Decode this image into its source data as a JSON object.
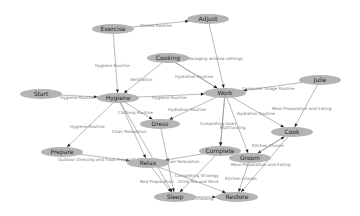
{
  "diagram": {
    "type": "directed-graph",
    "background": "#ffffff",
    "node_color": "#b4b4b4",
    "edge_color": "#8a8a8a",
    "nodes": [
      {
        "id": "exercise",
        "label": "Exercise",
        "x": 113,
        "y": 29,
        "rx": 21,
        "ry": 5
      },
      {
        "id": "adjust",
        "label": "Adjust",
        "x": 208,
        "y": 19,
        "rx": 21,
        "ry": 5
      },
      {
        "id": "cooking",
        "label": "Cooking",
        "x": 168,
        "y": 58,
        "rx": 21,
        "ry": 5
      },
      {
        "id": "start",
        "label": "Start",
        "x": 41,
        "y": 94,
        "rx": 21,
        "ry": 5
      },
      {
        "id": "hygiene",
        "label": "Hygiene",
        "x": 118,
        "y": 98,
        "rx": 21,
        "ry": 5
      },
      {
        "id": "work",
        "label": "Work",
        "x": 225,
        "y": 93,
        "rx": 21,
        "ry": 5
      },
      {
        "id": "julie",
        "label": "Julie",
        "x": 320,
        "y": 80,
        "rx": 21,
        "ry": 5
      },
      {
        "id": "dress",
        "label": "Dress",
        "x": 160,
        "y": 124,
        "rx": 20,
        "ry": 5
      },
      {
        "id": "cook",
        "label": "Cook",
        "x": 292,
        "y": 132,
        "rx": 21,
        "ry": 5
      },
      {
        "id": "prepare",
        "label": "Prepare",
        "x": 62,
        "y": 152,
        "rx": 21,
        "ry": 5
      },
      {
        "id": "complete",
        "label": "Complete",
        "x": 220,
        "y": 151,
        "rx": 21,
        "ry": 5
      },
      {
        "id": "relax",
        "label": "Relax",
        "x": 148,
        "y": 163,
        "rx": 21,
        "ry": 5
      },
      {
        "id": "groom",
        "label": "Groom",
        "x": 250,
        "y": 158,
        "rx": 21,
        "ry": 5
      },
      {
        "id": "sleep",
        "label": "Sleep",
        "x": 175,
        "y": 197,
        "rx": 21,
        "ry": 5
      },
      {
        "id": "restore",
        "label": "Restore",
        "x": 237,
        "y": 197,
        "rx": 21,
        "ry": 5
      }
    ],
    "edges": [
      {
        "from": "exercise",
        "to": "adjust",
        "label": "Fitness Routine",
        "lx": 140,
        "ly": 27
      },
      {
        "from": "exercise",
        "to": "hygiene",
        "label": "Hygiene Routine",
        "lx": 95,
        "ly": 67
      },
      {
        "from": "cooking",
        "to": "hygiene",
        "label": "Ventilation",
        "lx": 130,
        "ly": 81
      },
      {
        "from": "cooking",
        "to": "work",
        "label": "Managing window settings",
        "lx": 187,
        "ly": 60
      },
      {
        "from": "cooking",
        "to": "work",
        "label": "Hydration Routine",
        "lx": 175,
        "ly": 78
      },
      {
        "from": "adjust",
        "to": "work",
        "label": "",
        "lx": 0,
        "ly": 0
      },
      {
        "from": "start",
        "to": "hygiene",
        "label": "Hygiene Routine",
        "lx": 60,
        "ly": 99
      },
      {
        "from": "hygiene",
        "to": "work",
        "label": "Hygiene Routine",
        "lx": 152,
        "ly": 99
      },
      {
        "from": "julie",
        "to": "work",
        "label": "Computer Usage Routine",
        "lx": 242,
        "ly": 90
      },
      {
        "from": "hygiene",
        "to": "dress",
        "label": "Clothing Routine",
        "lx": 118,
        "ly": 114
      },
      {
        "from": "work",
        "to": "dress",
        "label": "Hydration Routine",
        "lx": 168,
        "ly": 111
      },
      {
        "from": "julie",
        "to": "cook",
        "label": "Meal Preparation and Eating",
        "lx": 272,
        "ly": 110
      },
      {
        "from": "hygiene",
        "to": "prepare",
        "label": "Hygiene Routine",
        "lx": 70,
        "ly": 128
      },
      {
        "from": "hygiene",
        "to": "relax",
        "label": "Chair Relaxation",
        "lx": 112,
        "ly": 133
      },
      {
        "from": "work",
        "to": "cook",
        "label": "Hydration Routine",
        "lx": 237,
        "ly": 115
      },
      {
        "from": "work",
        "to": "complete",
        "label": "Completing tasks",
        "lx": 200,
        "ly": 125
      },
      {
        "from": "work",
        "to": "complete",
        "label": "Multitasking",
        "lx": 220,
        "ly": 129
      },
      {
        "from": "prepare",
        "to": "relax",
        "label": "Outdoor Dressing and Food Preparation",
        "lx": 58,
        "ly": 161
      },
      {
        "from": "complete",
        "to": "relax",
        "label": "Chair Relaxation",
        "lx": 165,
        "ly": 163
      },
      {
        "from": "work",
        "to": "groom",
        "label": "",
        "lx": 0,
        "ly": 0
      },
      {
        "from": "cook",
        "to": "groom",
        "label": "Kitchen Chores",
        "lx": 252,
        "ly": 147
      },
      {
        "from": "groom",
        "to": "cook",
        "label": "Meal Preparation and Eating",
        "lx": 231,
        "ly": 166
      },
      {
        "from": "complete",
        "to": "sleep",
        "label": "Completing Strategy",
        "lx": 175,
        "ly": 177
      },
      {
        "from": "relax",
        "to": "sleep",
        "label": "Bed Preparation",
        "lx": 140,
        "ly": 183
      },
      {
        "from": "relax",
        "to": "restore",
        "label": "Drink Tea and Work",
        "lx": 178,
        "ly": 183
      },
      {
        "from": "groom",
        "to": "restore",
        "label": "Kitchen Chores",
        "lx": 225,
        "ly": 180
      },
      {
        "from": "sleep",
        "to": "restore",
        "label": "Multitasking",
        "lx": 188,
        "ly": 200
      },
      {
        "from": "cook",
        "to": "restore",
        "label": "",
        "lx": 0,
        "ly": 0
      },
      {
        "from": "dress",
        "to": "sleep",
        "label": "",
        "lx": 0,
        "ly": 0
      },
      {
        "from": "hygiene",
        "to": "sleep",
        "label": "",
        "lx": 0,
        "ly": 0
      }
    ]
  }
}
